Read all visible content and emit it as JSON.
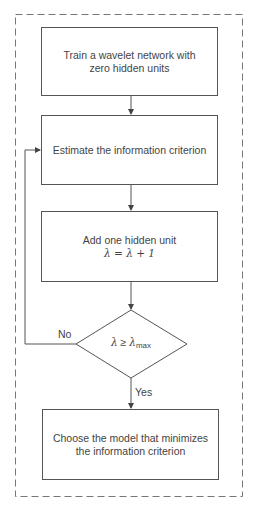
{
  "diagram": {
    "type": "flowchart",
    "boxes": [
      {
        "id": "train",
        "lines": [
          "Train a wavelet network with",
          "zero hidden units"
        ]
      },
      {
        "id": "estimate",
        "lines": [
          "Estimate the information criterion"
        ]
      },
      {
        "id": "add",
        "lines": [
          "Add one hidden unit",
          "λ = λ + 1"
        ]
      },
      {
        "id": "choose",
        "lines": [
          "Choose the model that minimizes",
          "the information criterion"
        ]
      }
    ],
    "decision": {
      "symbol": "λ",
      "operator": "≥",
      "rhs": "λ",
      "rhs_subscript": "max"
    },
    "edges": {
      "no_label": "No",
      "yes_label": "Yes"
    },
    "colors": {
      "line": "#555555",
      "border_dashed": "#777777",
      "text": "#444444"
    }
  }
}
